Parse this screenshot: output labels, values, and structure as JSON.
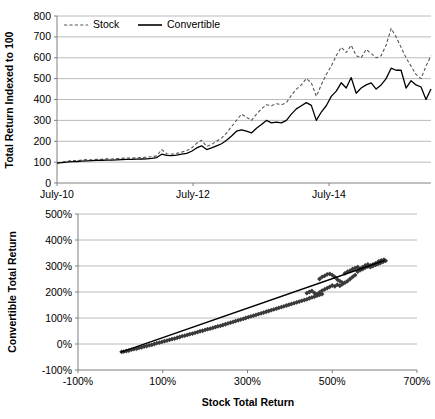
{
  "figure": {
    "name": "stock-vs-convertible-total-return-figure",
    "background": "#ffffff"
  },
  "chart_data": [
    {
      "id": "top",
      "type": "line",
      "title": "",
      "xlabel": "",
      "ylabel": "Total Return Indexed to 100",
      "ylim": [
        0,
        800
      ],
      "ytick_step": 100,
      "yticks": [
        "0",
        "100",
        "200",
        "300",
        "400",
        "500",
        "600",
        "700",
        "800"
      ],
      "xticks": [
        "July-10",
        "July-12",
        "July-14"
      ],
      "xtick_positions": [
        0,
        24,
        48
      ],
      "xlim": [
        0,
        66
      ],
      "grid": "horizontal",
      "legend": {
        "position": "top-left-inside",
        "entries": [
          {
            "label": "Stock",
            "style": "dashed",
            "color": "#555555"
          },
          {
            "label": "Convertible",
            "style": "solid",
            "color": "#000000"
          }
        ]
      },
      "series": [
        {
          "name": "Stock",
          "style": "dashed",
          "color": "#555555",
          "x": [
            0,
            1,
            2,
            3,
            4,
            5,
            6,
            7,
            8,
            9,
            10,
            11,
            12,
            13,
            14,
            15,
            16,
            17,
            18,
            19,
            20,
            21,
            22,
            23,
            24,
            25,
            26,
            27,
            28,
            29,
            30,
            31,
            32,
            33,
            34,
            35,
            36,
            37,
            38,
            39,
            40,
            41,
            42,
            43,
            44,
            45,
            46,
            47,
            48,
            49,
            50,
            51,
            52,
            53,
            54,
            55,
            56,
            57,
            58,
            59,
            60,
            61,
            62,
            63,
            64,
            65,
            66
          ],
          "values": [
            96,
            100,
            104,
            108,
            107,
            110,
            112,
            111,
            113,
            114,
            116,
            115,
            117,
            118,
            120,
            119,
            121,
            122,
            124,
            126,
            130,
            160,
            140,
            138,
            142,
            148,
            155,
            168,
            190,
            205,
            175,
            185,
            200,
            215,
            240,
            270,
            300,
            330,
            315,
            300,
            330,
            355,
            375,
            370,
            380,
            375,
            385,
            420,
            450,
            470,
            500,
            480,
            415,
            470,
            520,
            560,
            610,
            650,
            625,
            660,
            610,
            600,
            640,
            620,
            600,
            610,
            660,
            740,
            700,
            650,
            600,
            560,
            520,
            500,
            560,
            610
          ]
        },
        {
          "name": "Convertible",
          "style": "solid",
          "color": "#000000",
          "x": [
            0,
            1,
            2,
            3,
            4,
            5,
            6,
            7,
            8,
            9,
            10,
            11,
            12,
            13,
            14,
            15,
            16,
            17,
            18,
            19,
            20,
            21,
            22,
            23,
            24,
            25,
            26,
            27,
            28,
            29,
            30,
            31,
            32,
            33,
            34,
            35,
            36,
            37,
            38,
            39,
            40,
            41,
            42,
            43,
            44,
            45,
            46,
            47,
            48,
            49,
            50,
            51,
            52,
            53,
            54,
            55,
            56,
            57,
            58,
            59,
            60,
            61,
            62,
            63,
            64,
            65,
            66
          ],
          "values": [
            95,
            98,
            100,
            102,
            103,
            105,
            106,
            107,
            108,
            109,
            110,
            110,
            111,
            112,
            113,
            113,
            114,
            115,
            116,
            118,
            122,
            138,
            132,
            131,
            134,
            138,
            142,
            152,
            168,
            178,
            160,
            168,
            178,
            188,
            205,
            225,
            248,
            255,
            248,
            240,
            262,
            280,
            300,
            288,
            292,
            288,
            300,
            330,
            355,
            370,
            385,
            372,
            300,
            340,
            370,
            415,
            440,
            480,
            455,
            505,
            430,
            455,
            470,
            480,
            450,
            470,
            500,
            550,
            540,
            540,
            455,
            490,
            470,
            460,
            400,
            450
          ]
        }
      ]
    },
    {
      "id": "bottom",
      "type": "scatter",
      "title": "",
      "xlabel": "Stock Total Return",
      "ylabel": "Convertible Total Return",
      "xlim": [
        -100,
        700
      ],
      "ylim": [
        -100,
        500
      ],
      "xticks": [
        "-100%",
        "100%",
        "300%",
        "500%",
        "700%"
      ],
      "xtick_values": [
        -100,
        100,
        300,
        500,
        700
      ],
      "yticks": [
        "-100%",
        "0%",
        "100%",
        "200%",
        "300%",
        "400%",
        "500%"
      ],
      "ytick_values": [
        -100,
        0,
        100,
        200,
        300,
        400,
        500
      ],
      "grid": "horizontal",
      "marker": "diamond",
      "marker_color": "#3a3a3a",
      "trendline": {
        "present": true,
        "color": "#000000",
        "x_from": 0,
        "y_from": -32,
        "x_to": 625,
        "y_to": 322
      },
      "points_note": "dense cloud of ~350 monthly observations along a near-linear relation from (0%,-30%) to (630%,325%), with a wider cluster between 450% and 560% on the x axis",
      "points": [
        [
          3,
          -30
        ],
        [
          8,
          -29
        ],
        [
          14,
          -27
        ],
        [
          20,
          -25
        ],
        [
          26,
          -22
        ],
        [
          32,
          -20
        ],
        [
          38,
          -18
        ],
        [
          44,
          -15
        ],
        [
          50,
          -13
        ],
        [
          56,
          -10
        ],
        [
          62,
          -8
        ],
        [
          68,
          -5
        ],
        [
          74,
          -3
        ],
        [
          80,
          0
        ],
        [
          86,
          3
        ],
        [
          92,
          5
        ],
        [
          98,
          8
        ],
        [
          104,
          11
        ],
        [
          110,
          13
        ],
        [
          116,
          16
        ],
        [
          122,
          19
        ],
        [
          128,
          21
        ],
        [
          134,
          24
        ],
        [
          140,
          27
        ],
        [
          146,
          30
        ],
        [
          152,
          32
        ],
        [
          158,
          35
        ],
        [
          164,
          38
        ],
        [
          170,
          40
        ],
        [
          176,
          43
        ],
        [
          182,
          46
        ],
        [
          188,
          49
        ],
        [
          194,
          51
        ],
        [
          200,
          54
        ],
        [
          206,
          57
        ],
        [
          212,
          59
        ],
        [
          218,
          62
        ],
        [
          224,
          65
        ],
        [
          230,
          68
        ],
        [
          236,
          70
        ],
        [
          242,
          73
        ],
        [
          248,
          76
        ],
        [
          254,
          79
        ],
        [
          260,
          82
        ],
        [
          266,
          85
        ],
        [
          272,
          88
        ],
        [
          278,
          91
        ],
        [
          284,
          94
        ],
        [
          290,
          97
        ],
        [
          296,
          100
        ],
        [
          302,
          103
        ],
        [
          308,
          106
        ],
        [
          314,
          109
        ],
        [
          320,
          112
        ],
        [
          326,
          115
        ],
        [
          332,
          118
        ],
        [
          338,
          121
        ],
        [
          344,
          124
        ],
        [
          350,
          127
        ],
        [
          356,
          130
        ],
        [
          362,
          133
        ],
        [
          368,
          136
        ],
        [
          374,
          139
        ],
        [
          380,
          142
        ],
        [
          386,
          145
        ],
        [
          392,
          148
        ],
        [
          398,
          151
        ],
        [
          404,
          154
        ],
        [
          410,
          157
        ],
        [
          416,
          160
        ],
        [
          422,
          163
        ],
        [
          428,
          166
        ],
        [
          434,
          169
        ],
        [
          440,
          172
        ],
        [
          446,
          176
        ],
        [
          452,
          179
        ],
        [
          458,
          182
        ],
        [
          464,
          186
        ],
        [
          470,
          189
        ],
        [
          476,
          192
        ],
        [
          440,
          196
        ],
        [
          446,
          200
        ],
        [
          452,
          204
        ],
        [
          458,
          196
        ],
        [
          464,
          192
        ],
        [
          470,
          198
        ],
        [
          476,
          205
        ],
        [
          482,
          210
        ],
        [
          488,
          215
        ],
        [
          494,
          220
        ],
        [
          470,
          250
        ],
        [
          476,
          258
        ],
        [
          482,
          262
        ],
        [
          488,
          268
        ],
        [
          494,
          270
        ],
        [
          500,
          265
        ],
        [
          506,
          258
        ],
        [
          512,
          248
        ],
        [
          518,
          242
        ],
        [
          524,
          236
        ],
        [
          500,
          225
        ],
        [
          506,
          222
        ],
        [
          512,
          228
        ],
        [
          518,
          224
        ],
        [
          524,
          230
        ],
        [
          530,
          236
        ],
        [
          536,
          242
        ],
        [
          542,
          250
        ],
        [
          548,
          258
        ],
        [
          554,
          265
        ],
        [
          530,
          272
        ],
        [
          536,
          278
        ],
        [
          542,
          282
        ],
        [
          548,
          288
        ],
        [
          554,
          292
        ],
        [
          560,
          296
        ],
        [
          566,
          290
        ],
        [
          572,
          296
        ],
        [
          578,
          302
        ],
        [
          584,
          306
        ],
        [
          560,
          278
        ],
        [
          566,
          284
        ],
        [
          572,
          288
        ],
        [
          578,
          294
        ],
        [
          584,
          298
        ],
        [
          590,
          302
        ],
        [
          596,
          306
        ],
        [
          602,
          310
        ],
        [
          608,
          314
        ],
        [
          614,
          318
        ],
        [
          590,
          296
        ],
        [
          596,
          300
        ],
        [
          602,
          304
        ],
        [
          608,
          308
        ],
        [
          614,
          312
        ],
        [
          620,
          316
        ],
        [
          626,
          320
        ],
        [
          622,
          324
        ],
        [
          616,
          322
        ],
        [
          610,
          318
        ]
      ]
    }
  ]
}
